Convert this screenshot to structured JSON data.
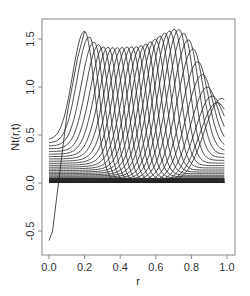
{
  "chart_data": {
    "type": "line",
    "title": "",
    "xlabel": "r",
    "ylabel": "Nt(r,t)",
    "xlim": [
      0.0,
      1.0
    ],
    "ylim": [
      -0.6,
      1.65
    ],
    "xticks": [
      0.0,
      0.2,
      0.4,
      0.6,
      0.8,
      1.0
    ],
    "xtick_labels": [
      "0.0",
      "0.2",
      "0.4",
      "0.6",
      "0.8",
      "1.0"
    ],
    "yticks": [
      -0.5,
      0.0,
      0.5,
      1.0,
      1.5
    ],
    "ytick_labels": [
      "-0.5",
      "0.0",
      "0.5",
      "1.0",
      "1.5"
    ],
    "grid": false,
    "legend": null,
    "line_color": "#222222",
    "peak_envelope": {
      "r": [
        0.2,
        0.25,
        0.3,
        0.35,
        0.4,
        0.45,
        0.5,
        0.55,
        0.6,
        0.65,
        0.7,
        0.72,
        0.75,
        0.8,
        0.85,
        0.9,
        0.95,
        0.97
      ],
      "value": [
        1.58,
        1.47,
        1.42,
        1.41,
        1.41,
        1.42,
        1.42,
        1.45,
        1.5,
        1.56,
        1.6,
        1.61,
        1.58,
        1.45,
        1.2,
        0.95,
        0.82,
        0.88
      ]
    },
    "start_values_at_r0": [
      0.45,
      0.4,
      0.33,
      0.28,
      0.24,
      0.2,
      0.17,
      0.14,
      0.12,
      0.1,
      0.08,
      0.06,
      0.05,
      0.04,
      0.03,
      0.02,
      0.01
    ],
    "tail_values_at_r1": [
      0.65,
      0.58,
      0.5,
      0.42,
      0.35,
      0.28,
      0.22,
      0.17,
      0.12,
      0.08,
      0.05,
      0.03,
      0.01
    ],
    "steep_curve": {
      "r": [
        0.0,
        0.02,
        0.04,
        0.06,
        0.08,
        0.1,
        0.13,
        0.16,
        0.2
      ],
      "value": [
        -0.6,
        -0.5,
        -0.2,
        0.1,
        0.4,
        0.7,
        1.0,
        1.3,
        1.58
      ]
    }
  }
}
